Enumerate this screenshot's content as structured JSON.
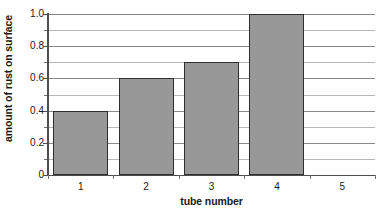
{
  "chart_data": {
    "type": "bar",
    "title": "",
    "xlabel": "tube number",
    "ylabel": "amount of rust on surface",
    "categories": [
      "1",
      "2",
      "3",
      "4",
      "5"
    ],
    "values": [
      0.4,
      0.6,
      0.7,
      1.0,
      null
    ],
    "ylim": [
      0,
      1.0
    ],
    "y_major_ticks": [
      "0",
      "0.2",
      "0.4",
      "0.6",
      "0.8",
      "1.0"
    ],
    "y_major_values": [
      0,
      0.2,
      0.4,
      0.6,
      0.8,
      1.0
    ],
    "y_minor_values": [
      0.1,
      0.3,
      0.5,
      0.7,
      0.9
    ],
    "grid": "horizontal",
    "legend": "none",
    "series": [
      {
        "name": "amount of rust on surface",
        "values": [
          0.4,
          0.6,
          0.7,
          1.0,
          null
        ]
      }
    ],
    "colors": {
      "bar_fill": "#989898",
      "bar_border": "#2e2e2e",
      "gridline_major": "#8a8a8a",
      "gridline_minor": "#b9b9b9",
      "axis": "#4d4d4d",
      "background": "#ffffff",
      "text": "#1a1a1a"
    }
  }
}
